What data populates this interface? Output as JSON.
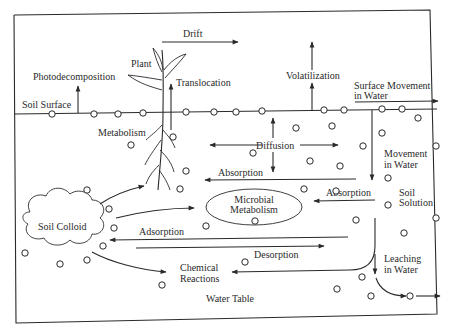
{
  "diagram": {
    "frame_color": "#2a2a2a",
    "background": "#ffffff",
    "labels": {
      "soil_surface": "Soil Surface",
      "photodecomposition": "Photodecomposition",
      "plant": "Plant",
      "drift": "Drift",
      "translocation": "Translocation",
      "volatilization": "Volatilization",
      "surface_movement_1": "Surface Movement",
      "surface_movement_2": "in Water",
      "metabolism": "Metabolism",
      "diffusion": "Diffusion",
      "movement_in_water_1": "Movement",
      "movement_in_water_2": "in Water",
      "absorption_root": "Absorption",
      "absorption_microbial": "Absorption",
      "soil_solution_1": "Soil",
      "soil_solution_2": "Solution",
      "soil_colloid": "Soil Colloid",
      "microbial_metabolism_1": "Microbial",
      "microbial_metabolism_2": "Metabolism",
      "adsorption": "Adsorption",
      "desorption": "Desorption",
      "chemical_reactions_1": "Chemical",
      "chemical_reactions_2": "Reactions",
      "leaching_1": "Leaching",
      "leaching_2": "in Water",
      "water_table": "Water Table"
    },
    "nodes": [
      "Plant",
      "Soil Colloid",
      "Microbial Metabolism",
      "Soil Solution",
      "Chemical Reactions",
      "Water Table"
    ],
    "processes": [
      "Photodecomposition",
      "Drift",
      "Translocation",
      "Volatilization",
      "Surface Movement in Water",
      "Metabolism",
      "Diffusion",
      "Absorption",
      "Movement in Water",
      "Adsorption",
      "Desorption",
      "Leaching in Water"
    ]
  }
}
